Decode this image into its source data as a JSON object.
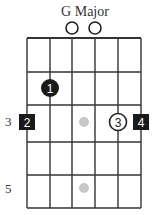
{
  "title": "G Major",
  "grid": {
    "strings_x": [
      27,
      50,
      72,
      95,
      118,
      141
    ],
    "frets_y": [
      38,
      72,
      105,
      142,
      175,
      208
    ],
    "line_color": "#333333"
  },
  "open_strings": [
    {
      "string": 3,
      "x": 72,
      "y": 28
    },
    {
      "string": 4,
      "x": 95,
      "y": 28
    }
  ],
  "fret_labels": [
    {
      "label": "3",
      "x": 5,
      "y": 114
    },
    {
      "label": "5",
      "x": 5,
      "y": 181
    }
  ],
  "fingers": [
    {
      "finger": "1",
      "shape": "circle-filled",
      "string": 2,
      "x": 50,
      "y": 88
    },
    {
      "finger": "2",
      "shape": "square-filled",
      "string": 1,
      "x": 27,
      "y": 122
    },
    {
      "finger": "3",
      "shape": "circle-open",
      "string": 5,
      "x": 118,
      "y": 122
    },
    {
      "finger": "4",
      "shape": "square-filled",
      "string": 6,
      "x": 141,
      "y": 122
    }
  ],
  "fret_markers": [
    {
      "x": 84,
      "y": 122
    },
    {
      "x": 84,
      "y": 188
    }
  ],
  "colors": {
    "filled": "#1a1a1a",
    "marker": "#c8c8c8",
    "text_on_filled": "#ffffff"
  }
}
